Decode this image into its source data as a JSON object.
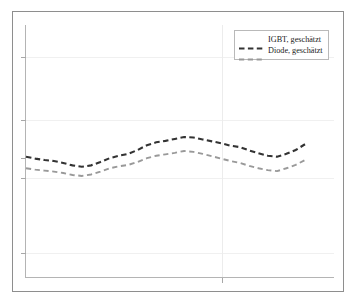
{
  "figure": {
    "title": "",
    "background_color": "#ffffff",
    "frame_color": "#8e8e8e",
    "axis_color": "#b4b4b4",
    "grid_color": "#f0f0f0"
  },
  "legend": {
    "position": "top-right",
    "border_color": "#b9b9b9",
    "entries": [
      {
        "label": "IGBT, geschätzt",
        "color": "#333333",
        "dash": "dashed"
      },
      {
        "label": "Diode, geschätzt",
        "color": "#999999",
        "dash": "dashed"
      }
    ]
  },
  "chart_data": {
    "type": "line",
    "title": "",
    "xlabel": "",
    "ylabel": "",
    "xlim": [
      0,
      30
    ],
    "ylim": [
      0,
      100
    ],
    "grid": true,
    "x_tick_labels": [],
    "y_tick_labels": [],
    "legend_position": "top-right",
    "series": [
      {
        "name": "IGBT, geschätzt",
        "color": "#333333",
        "dash": "dashed",
        "x": [
          0,
          1,
          2,
          3,
          4,
          5,
          6,
          7,
          8,
          9,
          10,
          11,
          12,
          13,
          14,
          15,
          16,
          17,
          18,
          19,
          20,
          21,
          22,
          23,
          24,
          25,
          26,
          27,
          28,
          29,
          30
        ],
        "values": [
          47.2,
          46.4,
          45.8,
          45.4,
          44.6,
          43.6,
          43.0,
          43.6,
          45.0,
          46.6,
          47.6,
          48.4,
          50.0,
          52.0,
          53.2,
          53.8,
          54.6,
          55.4,
          55.2,
          54.4,
          53.6,
          52.8,
          51.8,
          51.2,
          49.8,
          48.6,
          47.6,
          47.2,
          48.4,
          50.0,
          52.4
        ]
      },
      {
        "name": "Diode, geschätzt",
        "color": "#999999",
        "dash": "dashed",
        "x": [
          0,
          1,
          2,
          3,
          4,
          5,
          6,
          7,
          8,
          9,
          10,
          11,
          12,
          13,
          14,
          15,
          16,
          17,
          18,
          19,
          20,
          21,
          22,
          23,
          24,
          25,
          26,
          27,
          28,
          29,
          30
        ],
        "values": [
          42.4,
          41.8,
          41.4,
          41.0,
          40.4,
          39.6,
          39.2,
          39.8,
          41.0,
          42.4,
          43.2,
          43.8,
          45.0,
          46.6,
          47.6,
          48.2,
          48.8,
          49.6,
          49.2,
          48.4,
          47.4,
          46.4,
          45.4,
          44.6,
          43.4,
          42.4,
          41.6,
          41.2,
          42.4,
          43.8,
          45.8
        ]
      }
    ]
  },
  "axes": {
    "y_ticks_px": [
      57,
      120,
      178,
      253
    ],
    "x_ticks_px": [
      222
    ],
    "v_gridlines_px": [
      222
    ],
    "h_gridlines_px": [
      57,
      120,
      178,
      253
    ]
  }
}
